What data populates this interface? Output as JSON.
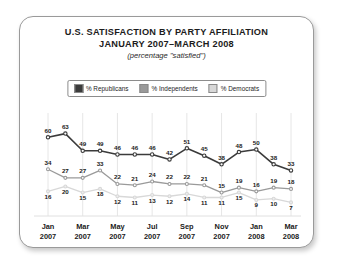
{
  "card": {
    "title_line1": "U.S. SATISFACTION BY PARTY AFFILIATION",
    "title_line2": "JANUARY 2007–MARCH 2008",
    "subtitle": "(percentage \"satisfied\")"
  },
  "legend": {
    "position": "top-center",
    "items": [
      {
        "label": "% Republicans",
        "color": "#3b3b3b"
      },
      {
        "label": "% Independents",
        "color": "#9a9a9a"
      },
      {
        "label": "% Democrats",
        "color": "#d8d8d8"
      }
    ]
  },
  "chart_data": {
    "type": "line",
    "title": "U.S. SATISFACTION BY PARTY AFFILIATION JANUARY 2007–MARCH 2008",
    "subtitle": "(percentage \"satisfied\")",
    "xlabel": "",
    "ylabel": "",
    "ylim": [
      0,
      70
    ],
    "grid": "vertical-only",
    "legend_position": "top-center",
    "x": [
      "Jan 2007",
      "Feb 2007",
      "Mar 2007",
      "Apr 2007",
      "May 2007",
      "Jun 2007",
      "Jul 2007",
      "Aug 2007",
      "Sep 2007",
      "Oct 2007",
      "Nov 2007",
      "Dec 2007",
      "Jan 2008",
      "Feb 2008",
      "Mar 2008"
    ],
    "tick_labels": [
      {
        "index": 0,
        "line1": "Jan",
        "line2": "2007"
      },
      {
        "index": 2,
        "line1": "Mar",
        "line2": "2007"
      },
      {
        "index": 4,
        "line1": "May",
        "line2": "2007"
      },
      {
        "index": 6,
        "line1": "Jul",
        "line2": "2007"
      },
      {
        "index": 8,
        "line1": "Sep",
        "line2": "2007"
      },
      {
        "index": 10,
        "line1": "Nov",
        "line2": "2007"
      },
      {
        "index": 12,
        "line1": "Jan",
        "line2": "2008"
      },
      {
        "index": 14,
        "line1": "Mar",
        "line2": "2008"
      }
    ],
    "series": [
      {
        "name": "% Republicans",
        "color": "#3b3b3b",
        "values": [
          60,
          63,
          49,
          49,
          46,
          46,
          46,
          42,
          51,
          45,
          38,
          48,
          50,
          38,
          33
        ]
      },
      {
        "name": "% Independents",
        "color": "#9a9a9a",
        "values": [
          34,
          27,
          27,
          33,
          22,
          21,
          24,
          22,
          22,
          21,
          15,
          19,
          16,
          19,
          18
        ]
      },
      {
        "name": "% Democrats",
        "color": "#d8d8d8",
        "values": [
          16,
          20,
          15,
          18,
          12,
          11,
          13,
          12,
          14,
          11,
          11,
          15,
          9,
          10,
          7
        ]
      }
    ]
  }
}
